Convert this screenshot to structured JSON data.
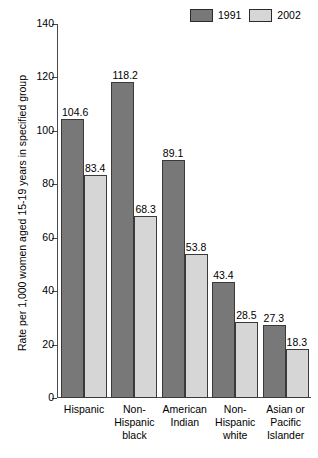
{
  "chart_data": {
    "type": "bar",
    "title": "",
    "xlabel": "",
    "ylabel": "Rate per 1,000 women aged 15-19 years in specified group",
    "ylim": [
      0,
      140
    ],
    "yticks": [
      0,
      20,
      40,
      60,
      80,
      100,
      120,
      140
    ],
    "grid": false,
    "legend_position": "top-right",
    "categories": [
      "Hispanic",
      "Non-Hispanic black",
      "American Indian",
      "Non-Hispanic white",
      "Asian or Pacific Islander"
    ],
    "category_lines": [
      [
        "Hispanic"
      ],
      [
        "Non-",
        "Hispanic",
        "black"
      ],
      [
        "American",
        "Indian"
      ],
      [
        "Non-",
        "Hispanic",
        "white"
      ],
      [
        "Asian or",
        "Pacific",
        "Islander"
      ]
    ],
    "series": [
      {
        "name": "1991",
        "color": "#787878",
        "values": [
          104.6,
          118.2,
          89.1,
          43.4,
          27.3
        ],
        "labels": [
          "104.6",
          "118.2",
          "89.1",
          "43.4",
          "27.3"
        ]
      },
      {
        "name": "2002",
        "color": "#d6d6d6",
        "values": [
          83.4,
          68.3,
          53.8,
          28.5,
          18.3
        ],
        "labels": [
          "83.4",
          "68.3",
          "53.8",
          "28.5",
          "18.3"
        ]
      }
    ]
  },
  "axis": {
    "tick_labels": [
      "0",
      "20",
      "40",
      "60",
      "80",
      "100",
      "120",
      "140"
    ],
    "y_title": "Rate per 1,000 women aged 15-19 years in specified group"
  },
  "legend": {
    "entries": [
      {
        "label": "1991",
        "color": "#787878"
      },
      {
        "label": "2002",
        "color": "#d6d6d6"
      }
    ]
  }
}
